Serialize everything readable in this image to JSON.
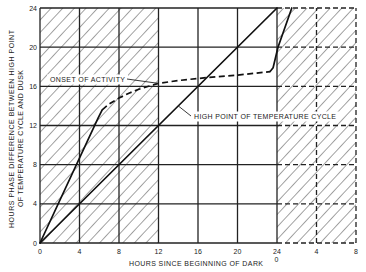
{
  "chart_data": {
    "type": "line",
    "title": "",
    "xlabel": "HOURS SINCE BEGINNING OF DARK",
    "ylabel": [
      "HOURS PHASE DIFFERENCE BETWEEN HIGH POINT",
      "OF TEMPERATURE CYCLE AND DUSK"
    ],
    "xlim": [
      0,
      32
    ],
    "ylim": [
      0,
      24
    ],
    "grid": true,
    "x_ticks": [
      {
        "value": 0,
        "label": "0"
      },
      {
        "value": 4,
        "label": "4"
      },
      {
        "value": 8,
        "label": "8"
      },
      {
        "value": 12,
        "label": "12"
      },
      {
        "value": 16,
        "label": "16"
      },
      {
        "value": 20,
        "label": "20"
      },
      {
        "value": 24,
        "label": "24",
        "sublabel": "0"
      },
      {
        "value": 28,
        "label": "4"
      },
      {
        "value": 32,
        "label": "8"
      }
    ],
    "y_ticks": [
      {
        "value": 0,
        "label": "0"
      },
      {
        "value": 4,
        "label": "4"
      },
      {
        "value": 8,
        "label": "8"
      },
      {
        "value": 12,
        "label": "12"
      },
      {
        "value": 16,
        "label": "16"
      },
      {
        "value": 20,
        "label": "20"
      },
      {
        "value": 24,
        "label": "24"
      }
    ],
    "shaded_regions": [
      {
        "from": 0,
        "to": 12,
        "pattern": "diagonal-hatch"
      },
      {
        "from": 24,
        "to": 32,
        "pattern": "diagonal-hatch"
      }
    ],
    "dashed_grid_region": [
      24,
      32
    ],
    "series": [
      {
        "name": "High point of temperature cycle",
        "segments": [
          {
            "style": "solid",
            "points": [
              [
                0,
                0
              ],
              [
                24,
                24
              ]
            ]
          }
        ]
      },
      {
        "name": "Onset of activity",
        "segments": [
          {
            "style": "solid",
            "points": [
              [
                0,
                0
              ],
              [
                5.9,
                12.8
              ],
              [
                6.3,
                13.6
              ]
            ]
          },
          {
            "style": "dashed",
            "points": [
              [
                6.3,
                13.6
              ],
              [
                7,
                14.2
              ],
              [
                8,
                14.8
              ],
              [
                9,
                15.3
              ],
              [
                10,
                15.7
              ],
              [
                11,
                16.0
              ],
              [
                12,
                16.3
              ],
              [
                14,
                16.6
              ],
              [
                17,
                16.9
              ],
              [
                20,
                17.15
              ],
              [
                23.3,
                17.5
              ]
            ]
          },
          {
            "style": "solid",
            "points": [
              [
                23.3,
                17.5
              ],
              [
                23.6,
                17.9
              ],
              [
                24.1,
                20
              ],
              [
                25.5,
                24
              ]
            ]
          }
        ]
      }
    ],
    "annotations": [
      {
        "text": "ONSET OF ACTIVITY",
        "points_to": [
          12,
          16.3
        ]
      },
      {
        "text": "HIGH POINT OF TEMPERATURE CYCLE",
        "points_to": [
          14,
          14
        ]
      }
    ],
    "colors": {
      "ink": "#1a1a1a",
      "background": "#ffffff"
    }
  }
}
